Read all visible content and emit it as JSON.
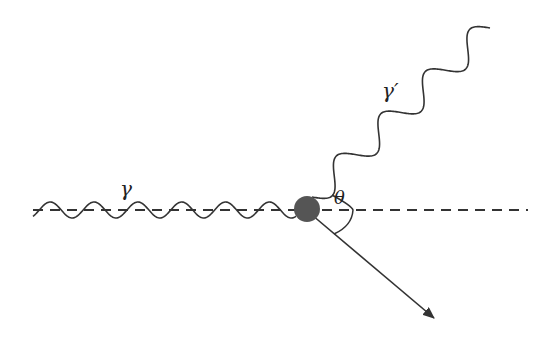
{
  "diagram": {
    "labels": {
      "incoming_photon": "γ",
      "scattered_photon": "γ′",
      "angle": "θ"
    },
    "colors": {
      "line": "#333333",
      "particle": "#555555",
      "background": "#ffffff"
    }
  }
}
